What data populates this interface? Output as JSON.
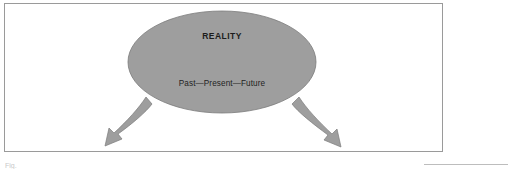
{
  "figure": {
    "title_label": "REALITY",
    "timeline_label": "Past—Present—Future",
    "footer_caption": "Fig.",
    "colors": {
      "shape_fill": "#9e9e9e",
      "shape_stroke": "#7b7b7b",
      "frame_border": "#9a9a9a",
      "background": "#ffffff",
      "text": "#1c1c1c",
      "footer_rule": "#bdbdbd"
    },
    "shapes": {
      "ellipse": {
        "name": "reality-ellipse",
        "cx": 222,
        "cy": 62,
        "rx": 94,
        "ry": 51
      },
      "arrows": [
        {
          "name": "left-arrow",
          "direction": "down-left",
          "tip_x": 108,
          "tip_y": 146
        },
        {
          "name": "right-arrow",
          "direction": "down-right",
          "tip_x": 338,
          "tip_y": 147
        }
      ]
    }
  }
}
